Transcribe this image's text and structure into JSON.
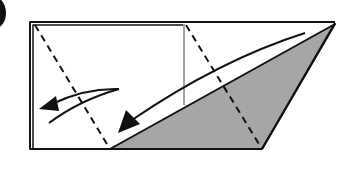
{
  "diagram": {
    "type": "origami-fold-step",
    "step_number_visible": false,
    "colors": {
      "stroke": "#111111",
      "fill_shaded": "#a6a6a6",
      "paper": "#ffffff"
    },
    "elements": [
      {
        "name": "paper-outline",
        "kind": "polygon",
        "points": [
          [
            30,
            22
          ],
          [
            335,
            22
          ],
          [
            262,
            149
          ],
          [
            30,
            149
          ]
        ]
      },
      {
        "name": "shaded-flap",
        "kind": "triangle",
        "points": [
          [
            110,
            149
          ],
          [
            335,
            24
          ],
          [
            262,
            149
          ]
        ]
      },
      {
        "name": "dashed-fold-line-left",
        "kind": "valley-fold",
        "from": [
          35,
          25
        ],
        "to": [
          110,
          149
        ]
      },
      {
        "name": "dashed-fold-line-right",
        "kind": "valley-fold",
        "from": [
          186,
          25
        ],
        "to": [
          262,
          149
        ]
      },
      {
        "name": "vertical-crease",
        "kind": "line",
        "from": [
          184,
          24
        ],
        "to": [
          184,
          105
        ]
      },
      {
        "name": "fold-arrow-long",
        "kind": "arrow",
        "direction": "down-left"
      },
      {
        "name": "fold-arrow-short",
        "kind": "arrow",
        "direction": "left"
      }
    ]
  }
}
